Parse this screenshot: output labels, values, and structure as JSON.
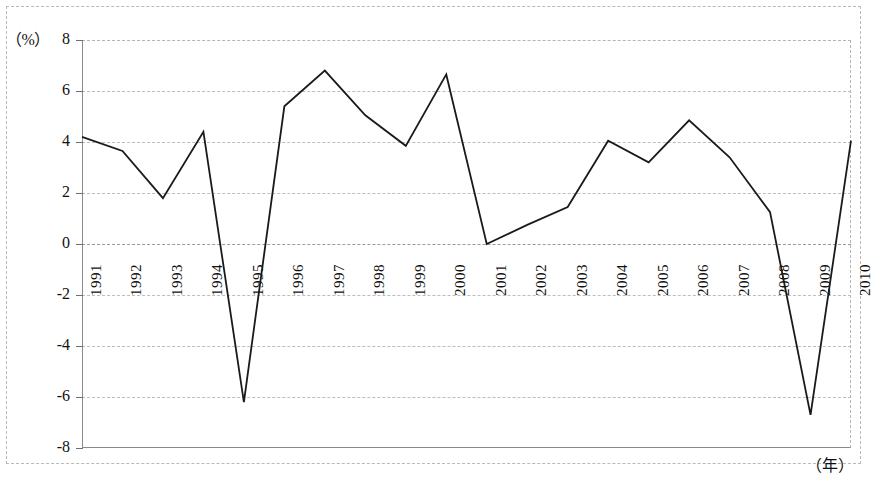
{
  "figure": {
    "unit_label": "（%）",
    "x_axis_label": "（年）"
  },
  "chart_data": {
    "type": "line",
    "title": "",
    "subtitle": "",
    "xlabel": "（年）",
    "ylabel": "（%）",
    "categories": [
      "1991",
      "1992",
      "1993",
      "1994",
      "1995",
      "1996",
      "1997",
      "1998",
      "1999",
      "2000",
      "2001",
      "2002",
      "2003",
      "2004",
      "2005",
      "2006",
      "2007",
      "2008",
      "2009",
      "2010"
    ],
    "values": [
      4.2,
      3.65,
      1.8,
      4.4,
      -6.2,
      5.4,
      6.8,
      5.05,
      3.85,
      6.65,
      0.0,
      0.75,
      1.45,
      4.05,
      3.2,
      4.85,
      3.4,
      1.25,
      -6.7,
      4.05
    ],
    "series": [
      {
        "name": "",
        "values": [
          4.2,
          3.65,
          1.8,
          4.4,
          -6.2,
          5.4,
          6.8,
          5.05,
          3.85,
          6.65,
          0.0,
          0.75,
          1.45,
          4.05,
          3.2,
          4.85,
          3.4,
          1.25,
          -6.7,
          4.05
        ]
      }
    ],
    "ylim": [
      -8,
      8
    ],
    "yticks": [
      8,
      6,
      4,
      2,
      0,
      -2,
      -4,
      -6,
      -8
    ],
    "ytick_labels": [
      "8",
      "6",
      "4",
      "2",
      "0",
      "-2",
      "-4",
      "-6",
      "-8"
    ],
    "xtick_labels": [
      "1991",
      "1992",
      "1993",
      "1994",
      "1995",
      "1996",
      "1997",
      "1998",
      "1999",
      "2000",
      "2001",
      "2002",
      "2003",
      "2004",
      "2005",
      "2006",
      "2007",
      "2008",
      "2009",
      "2010"
    ],
    "grid": true,
    "grid_style": "dashed-horizontal",
    "legend": false,
    "legend_position": "none",
    "line_color": "#1a1a1a",
    "line_width": 1.8,
    "markers": false
  },
  "colors": {
    "line": "#1a1a1a",
    "grid": "#bdbdbd",
    "axis": "#8a8a8a",
    "text": "#111111",
    "background": "#ffffff"
  }
}
